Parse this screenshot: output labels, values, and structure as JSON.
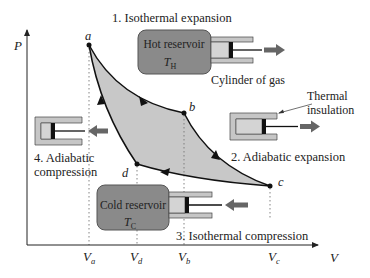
{
  "diagram": {
    "axes": {
      "y_label": "P",
      "x_label": "V",
      "x_ticks": [
        {
          "main": "V",
          "sub": "a"
        },
        {
          "main": "V",
          "sub": "d"
        },
        {
          "main": "V",
          "sub": "b"
        },
        {
          "main": "V",
          "sub": "c"
        }
      ]
    },
    "points": {
      "a": "a",
      "b": "b",
      "c": "c",
      "d": "d"
    },
    "steps": {
      "step1": "1. Isothermal expansion",
      "step2": "2. Adiabatic expansion",
      "step3": "3. Isothermal compression",
      "step4_line1": "4. Adiabatic",
      "step4_line2": "compression"
    },
    "hot_reservoir": {
      "label": "Hot reservoir",
      "temp_main": "T",
      "temp_sub": "H"
    },
    "cold_reservoir": {
      "label": "Cold reservoir",
      "temp_main": "T",
      "temp_sub": "C"
    },
    "annotations": {
      "cylinder": "Cylinder of gas",
      "insulation_line1": "Thermal",
      "insulation_line2": "insulation"
    },
    "colors": {
      "cycle_fill": "#c8c8c8",
      "reservoir_fill": "#8a8a8a",
      "cylinder_wall": "#c6c6c6",
      "gas_fill": "#d4d4d4",
      "arrow": "#666666",
      "line": "#111111"
    }
  }
}
